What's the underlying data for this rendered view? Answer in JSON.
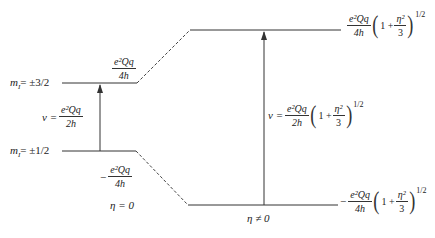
{
  "diagram": {
    "left_panel": {
      "condition": "η = 0",
      "levels": [
        {
          "label_m": "m",
          "label_sub": "I",
          "label_value": "= ±3/2",
          "energy_num": "e²Qq",
          "energy_den": "4h",
          "energy_sign": ""
        },
        {
          "label_m": "m",
          "label_sub": "I",
          "label_value": "= ±1/2",
          "energy_num": "e²Qq",
          "energy_den": "4h",
          "energy_sign": "−"
        }
      ],
      "transition": {
        "prefix": "v =",
        "num": "e²Qq",
        "den": "2h"
      }
    },
    "right_panel": {
      "condition": "η ≠ 0",
      "levels": [
        {
          "energy_sign": "",
          "energy_num": "e²Qq",
          "energy_den": "4h",
          "paren_one": "1 +",
          "paren_num": "η²",
          "paren_den": "3",
          "exponent": "1/2"
        },
        {
          "energy_sign": "−",
          "energy_num": "e²Qq",
          "energy_den": "4h",
          "paren_one": "1 +",
          "paren_num": "η²",
          "paren_den": "3",
          "exponent": "1/2"
        }
      ],
      "transition": {
        "prefix": "v =",
        "num": "e²Qq",
        "den": "2h",
        "paren_one": "1 +",
        "paren_num": "η²",
        "paren_den": "3",
        "exponent": "1/2"
      }
    },
    "colors": {
      "line": "#333333",
      "text": "#222222",
      "background": "#ffffff"
    }
  }
}
